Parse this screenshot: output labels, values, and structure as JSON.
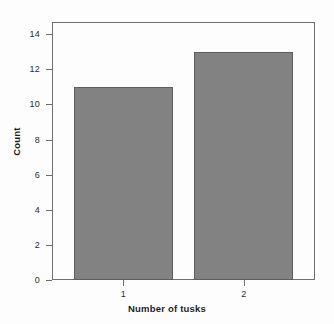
{
  "chart_data": {
    "type": "bar",
    "title": "",
    "subtitle": "",
    "xlabel": "Number of tusks",
    "ylabel": "Count",
    "categories": [
      "1",
      "2"
    ],
    "values": [
      11,
      13
    ],
    "series": [
      {
        "name": "Count",
        "values": [
          11,
          13
        ]
      }
    ],
    "ylim": [
      0,
      14.7
    ],
    "yticks": [
      0,
      2,
      4,
      6,
      8,
      10,
      12,
      14
    ],
    "ytick_labels": [
      "0",
      "2",
      "4",
      "6",
      "8",
      "10",
      "12",
      "14"
    ],
    "xtick_labels": [
      "1",
      "2"
    ],
    "grid": false,
    "legend": null,
    "legend_position": "none",
    "annotations": [],
    "colors": {
      "bar_fill": "#828282",
      "bar_border": "#5e5e5e",
      "axis": "#6f6f6f",
      "text": "#1e1e1e",
      "background": "#fdfdfd"
    }
  }
}
